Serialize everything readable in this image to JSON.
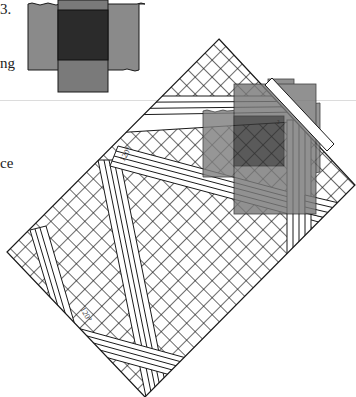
{
  "text_fragments": {
    "top": "3.",
    "middle": "ng",
    "lower": "ce"
  },
  "labels": {
    "angle_upper": "120°",
    "angle_lower": "120°",
    "corner_mark": "²"
  },
  "colors": {
    "light_gray": "#8a8a8a",
    "mid_gray": "#7a7a7a",
    "dark_square": "#2b2b2b",
    "line": "#1a1a1a",
    "rule": "#dcdcdc",
    "background": "#ffffff"
  },
  "diagram": {
    "type": "fabric-fold-illustration",
    "inset": {
      "description": "cross-shaped swatch: dark center square with gray side panels",
      "center": "dark square",
      "arms": [
        "top",
        "bottom",
        "left",
        "right"
      ]
    },
    "main": {
      "description": "rotated crosshatched rectangle with white stripe bands and gray overlay panels",
      "corners": {
        "top": [
          219,
          39
        ],
        "right": [
          355,
          185
        ],
        "bottom": [
          145,
          397
        ],
        "left": [
          7,
          252
        ]
      }
    }
  }
}
